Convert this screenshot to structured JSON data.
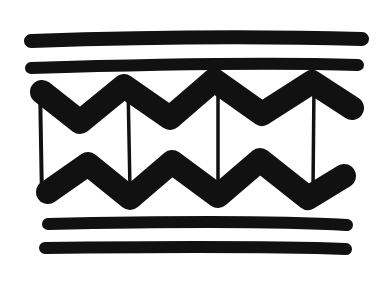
{
  "image": {
    "description": "Hand-drawn black ink decorative border pattern: two thick horizontal bands on top, two zigzag bands connected by vertical lines in the middle, two thick horizontal bands at the bottom",
    "background": "#ffffff",
    "ink": "#111111"
  },
  "pattern": {
    "top_bands": 2,
    "zigzag_rows": 2,
    "zigzag_peaks_per_row": 3,
    "vertical_dividers": 4,
    "bottom_bands": 2
  }
}
